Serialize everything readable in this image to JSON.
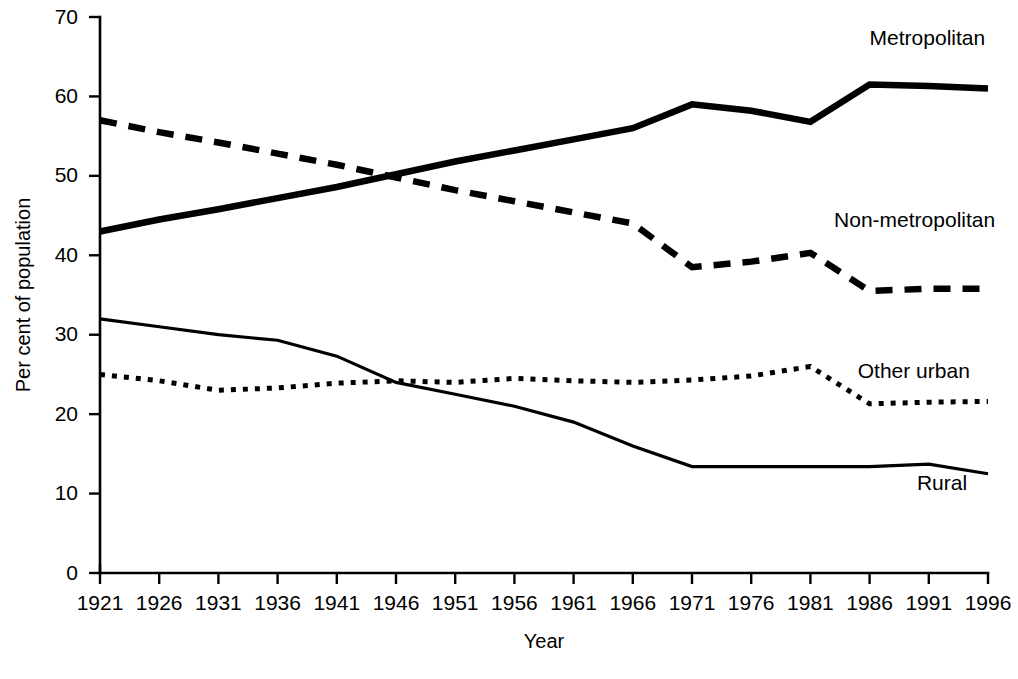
{
  "chart_data": {
    "type": "line",
    "title": "",
    "xlabel": "Year",
    "ylabel": "Per cent of population",
    "xlim": [
      1921,
      1996
    ],
    "ylim": [
      0,
      70
    ],
    "yticks": [
      0,
      10,
      20,
      30,
      40,
      50,
      60,
      70
    ],
    "ytick_labels": [
      "0",
      "10",
      "20",
      "30",
      "40",
      "50",
      "60",
      "70"
    ],
    "grid": false,
    "legend_position": "inline-right-of-series",
    "x": [
      1921,
      1926,
      1931,
      1936,
      1941,
      1946,
      1951,
      1956,
      1961,
      1966,
      1971,
      1976,
      1981,
      1986,
      1991,
      1996
    ],
    "xtick_labels": [
      "1921",
      "1926",
      "1931",
      "1936",
      "1941",
      "1946",
      "1951",
      "1956",
      "1961",
      "1966",
      "1971",
      "1976",
      "1981",
      "1986",
      "1991",
      "1996"
    ],
    "series": [
      {
        "name": "Metropolitan",
        "style": "thick-solid",
        "label_x": 1986,
        "label_y": 66.5,
        "values": [
          43.0,
          44.5,
          45.8,
          47.2,
          48.6,
          50.2,
          51.8,
          53.2,
          54.6,
          56.0,
          59.0,
          58.2,
          56.8,
          61.5,
          61.3,
          61.0
        ]
      },
      {
        "name": "Non-metropolitan",
        "style": "thick-dashed",
        "label_x": 1983,
        "label_y": 43.5,
        "values": [
          57.0,
          55.5,
          54.2,
          52.8,
          51.4,
          49.8,
          48.2,
          46.8,
          45.4,
          44.0,
          38.5,
          39.2,
          40.3,
          35.5,
          35.8,
          35.8
        ]
      },
      {
        "name": "Other urban",
        "style": "fine-dotted",
        "label_x": 1985,
        "label_y": 24.5,
        "values": [
          25.0,
          24.2,
          23.0,
          23.3,
          23.9,
          24.2,
          24.0,
          24.5,
          24.2,
          24.0,
          24.3,
          24.8,
          26.0,
          21.3,
          21.5,
          21.6
        ]
      },
      {
        "name": "Rural",
        "style": "thin-solid",
        "label_x": 1990,
        "label_y": 10.5,
        "values": [
          32.0,
          31.0,
          30.0,
          29.3,
          27.3,
          24.0,
          22.5,
          21.0,
          19.0,
          16.0,
          13.4,
          13.4,
          13.4,
          13.4,
          13.7,
          12.5
        ]
      }
    ]
  },
  "colors": {
    "ink": "#000000",
    "background": "#ffffff"
  }
}
